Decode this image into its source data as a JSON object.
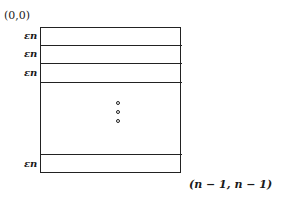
{
  "diagram": {
    "origin_label": "(0,0)",
    "corner_label": "(n − 1, n − 1)",
    "strip_label": "εn",
    "strips": [
      {
        "label": "εn",
        "top": 27,
        "bottom": 45
      },
      {
        "label": "εn",
        "top": 45,
        "bottom": 64
      },
      {
        "label": "εn",
        "top": 64,
        "bottom": 82
      },
      {
        "label": "εn",
        "top": 154,
        "bottom": 173
      }
    ],
    "ellipsis": "vertical dots",
    "line_color": "#222222"
  }
}
